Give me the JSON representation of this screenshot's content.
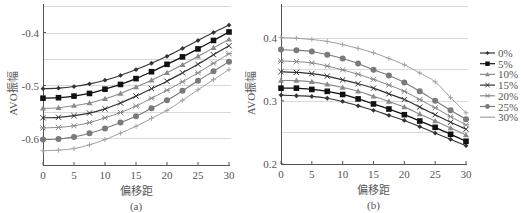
{
  "chart_data": [
    {
      "type": "line",
      "panel_label": "(a)",
      "title": "",
      "xlabel": "偏移距",
      "ylabel": "AVO振幅",
      "x": [
        0,
        2.5,
        5,
        7.5,
        10,
        12.5,
        15,
        17.5,
        20,
        22.5,
        25,
        27.5,
        30
      ],
      "xticks": [
        0,
        5,
        10,
        15,
        20,
        25,
        30
      ],
      "xlim": [
        0,
        30
      ],
      "yticks": [
        -0.4,
        -0.5,
        -0.6
      ],
      "ytick_labels": [
        "-0.4",
        "-0.5",
        "-0.6"
      ],
      "ylim": [
        -0.65,
        -0.35
      ],
      "grid": "horizontal",
      "series": [
        {
          "name": "0%",
          "values": [
            -0.506,
            -0.505,
            -0.502,
            -0.497,
            -0.49,
            -0.481,
            -0.47,
            -0.458,
            -0.445,
            -0.43,
            -0.415,
            -0.4,
            -0.386
          ]
        },
        {
          "name": "5%",
          "values": [
            -0.524,
            -0.523,
            -0.52,
            -0.515,
            -0.507,
            -0.498,
            -0.487,
            -0.474,
            -0.46,
            -0.446,
            -0.431,
            -0.415,
            -0.399
          ]
        },
        {
          "name": "10%",
          "values": [
            -0.543,
            -0.542,
            -0.538,
            -0.533,
            -0.525,
            -0.515,
            -0.503,
            -0.49,
            -0.476,
            -0.461,
            -0.445,
            -0.429,
            -0.413
          ]
        },
        {
          "name": "15%",
          "values": [
            -0.561,
            -0.56,
            -0.557,
            -0.552,
            -0.544,
            -0.533,
            -0.52,
            -0.506,
            -0.492,
            -0.476,
            -0.46,
            -0.442,
            -0.425
          ]
        },
        {
          "name": "20%",
          "values": [
            -0.58,
            -0.579,
            -0.576,
            -0.57,
            -0.561,
            -0.551,
            -0.539,
            -0.524,
            -0.509,
            -0.493,
            -0.476,
            -0.458,
            -0.44
          ]
        },
        {
          "name": "25%",
          "values": [
            -0.602,
            -0.601,
            -0.597,
            -0.59,
            -0.581,
            -0.57,
            -0.558,
            -0.543,
            -0.528,
            -0.51,
            -0.491,
            -0.473,
            -0.455
          ]
        },
        {
          "name": "30%",
          "values": [
            -0.623,
            -0.622,
            -0.619,
            -0.612,
            -0.602,
            -0.59,
            -0.577,
            -0.562,
            -0.547,
            -0.528,
            -0.508,
            -0.489,
            -0.47
          ]
        }
      ]
    },
    {
      "type": "line",
      "panel_label": "(b)",
      "title": "",
      "xlabel": "偏移距",
      "ylabel": "AVO振幅",
      "x": [
        0,
        2.5,
        5,
        7.5,
        10,
        12.5,
        15,
        17.5,
        20,
        22.5,
        25,
        27.5,
        30
      ],
      "xticks": [
        0,
        5,
        10,
        15,
        20,
        25,
        30
      ],
      "xlim": [
        0,
        30
      ],
      "yticks": [
        0.2,
        0.3,
        0.4
      ],
      "ytick_labels": [
        "0.2",
        "0.3",
        "0.4"
      ],
      "ylim": [
        0.2,
        0.45
      ],
      "grid": "horizontal",
      "legend_position": "right",
      "series": [
        {
          "name": "0%",
          "values": [
            0.309,
            0.308,
            0.307,
            0.304,
            0.299,
            0.292,
            0.285,
            0.277,
            0.269,
            0.259,
            0.249,
            0.239,
            0.229
          ]
        },
        {
          "name": "5%",
          "values": [
            0.32,
            0.32,
            0.318,
            0.315,
            0.31,
            0.303,
            0.295,
            0.287,
            0.278,
            0.268,
            0.258,
            0.247,
            0.236
          ]
        },
        {
          "name": "10%",
          "values": [
            0.332,
            0.332,
            0.33,
            0.326,
            0.321,
            0.315,
            0.307,
            0.299,
            0.29,
            0.279,
            0.268,
            0.257,
            0.246
          ]
        },
        {
          "name": "15%",
          "values": [
            0.346,
            0.345,
            0.343,
            0.339,
            0.333,
            0.327,
            0.32,
            0.311,
            0.302,
            0.29,
            0.278,
            0.266,
            0.255
          ]
        },
        {
          "name": "20%",
          "values": [
            0.363,
            0.362,
            0.36,
            0.355,
            0.349,
            0.342,
            0.334,
            0.325,
            0.315,
            0.302,
            0.289,
            0.275,
            0.262
          ]
        },
        {
          "name": "25%",
          "values": [
            0.381,
            0.38,
            0.378,
            0.373,
            0.367,
            0.359,
            0.349,
            0.34,
            0.329,
            0.315,
            0.3,
            0.285,
            0.271
          ]
        },
        {
          "name": "30%",
          "values": [
            0.4,
            0.399,
            0.397,
            0.394,
            0.389,
            0.383,
            0.376,
            0.367,
            0.357,
            0.344,
            0.33,
            0.305,
            0.281
          ]
        }
      ]
    }
  ],
  "legend": {
    "entries": [
      {
        "label": "0%",
        "marker": "diamond",
        "color": "#333333"
      },
      {
        "label": "5%",
        "marker": "square",
        "color": "#111111"
      },
      {
        "label": "10%",
        "marker": "triangle",
        "color": "#8a8a8a"
      },
      {
        "label": "15%",
        "marker": "x",
        "color": "#333333"
      },
      {
        "label": "20%",
        "marker": "asterisk",
        "color": "#8a8a8a"
      },
      {
        "label": "25%",
        "marker": "circle",
        "color": "#7a7a7a"
      },
      {
        "label": "30%",
        "marker": "plus",
        "color": "#a0a0a0"
      }
    ]
  },
  "colors": {
    "grid": "#d9d9d9",
    "axis": "#555555"
  }
}
